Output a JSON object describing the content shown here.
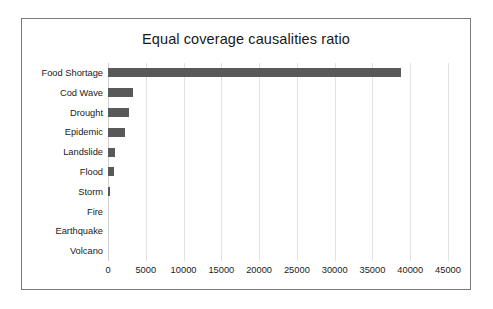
{
  "chart_data": {
    "type": "bar",
    "orientation": "horizontal",
    "title": "Equal coverage causalities ratio",
    "xlabel": "",
    "ylabel": "",
    "xlim": [
      0,
      45000
    ],
    "xticks": [
      0,
      5000,
      10000,
      15000,
      20000,
      25000,
      30000,
      35000,
      40000,
      45000
    ],
    "xtick_labels": [
      "0",
      "5000",
      "10000",
      "15000",
      "20000",
      "25000",
      "30000",
      "35000",
      "40000",
      "45000"
    ],
    "grid": true,
    "grid_axis": "x",
    "legend": false,
    "categories": [
      "Food Shortage",
      "Cod Wave",
      "Drought",
      "Epidemic",
      "Landslide",
      "Flood",
      "Storm",
      "Fire",
      "Earthquake",
      "Volcano"
    ],
    "values": [
      38800,
      3300,
      2800,
      2300,
      900,
      750,
      200,
      0,
      0,
      0
    ],
    "series": [
      {
        "name": "causalities",
        "values": [
          38800,
          3300,
          2800,
          2300,
          900,
          750,
          200,
          0,
          0,
          0
        ]
      }
    ],
    "colors": {
      "bar": "#595959",
      "gridline": "#e2e2e2",
      "text": "#1a1a1a",
      "frame": "#7a7a7a",
      "background": "#ffffff"
    }
  }
}
